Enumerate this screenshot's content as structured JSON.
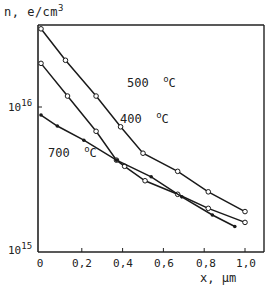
{
  "chart_data": {
    "type": "line",
    "title": "",
    "xlabel": "x, µm",
    "ylabel": "n, e/cm3",
    "yscale": "log",
    "xlim": [
      0,
      1.1
    ],
    "ylim": [
      1000000000000000.0,
      3.7e+16
    ],
    "grid": false,
    "x_ticks": [
      "0",
      "0,2",
      "0,4",
      "0,6",
      "0,8",
      "1,0"
    ],
    "y_ticks": [
      {
        "base": "10",
        "exp": "15",
        "value": 1000000000000000.0
      },
      {
        "base": "10",
        "exp": "16",
        "value": 1e+16
      }
    ],
    "series": [
      {
        "name": "500 °C",
        "label_text": "500",
        "label_unit": "C",
        "marker": "open-circle",
        "x": [
          0,
          0.12,
          0.27,
          0.39,
          0.5,
          0.67,
          0.82,
          1.0
        ],
        "y": [
          3.46e+16,
          2.1e+16,
          1.19e+16,
          7300000000000000.0,
          4800000000000000.0,
          3600000000000000.0,
          2600000000000000.0,
          1900000000000000.0
        ]
      },
      {
        "name": "400 °C",
        "label_text": "400",
        "label_unit": "C",
        "marker": "open-circle",
        "x": [
          0,
          0.13,
          0.27,
          0.37,
          0.41,
          0.51,
          0.67,
          0.82,
          1.0
        ],
        "y": [
          2e+16,
          1.19e+16,
          6800000000000000.0,
          4300000000000000.0,
          3900000000000000.0,
          3100000000000000.0,
          2500000000000000.0,
          2000000000000000.0,
          1600000000000000.0
        ]
      },
      {
        "name": "700 °C",
        "label_text": "700",
        "label_unit": "C",
        "marker": "filled-dot",
        "x": [
          0,
          0.08,
          0.21,
          0.37,
          0.54,
          0.69,
          0.84,
          0.95
        ],
        "y": [
          8800000000000000.0,
          7400000000000000.0,
          5900000000000000.0,
          4300000000000000.0,
          3300000000000000.0,
          2400000000000000.0,
          1800000000000000.0,
          1500000000000000.0
        ]
      }
    ]
  },
  "axis": {
    "ylabel_text": "n, e/cm",
    "ylabel_exp": "3",
    "xlabel_text": "x, µm",
    "degree_symbol": "o"
  }
}
